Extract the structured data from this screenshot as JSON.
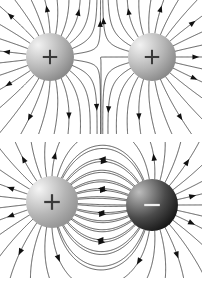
{
  "figure": {
    "background_color": "#ffffff",
    "width": 202,
    "height": 284,
    "line_color": "#4a4a4a",
    "arrow_color": "#111111"
  },
  "panels": [
    {
      "id": "panel-like",
      "name": "like-charges-panel",
      "caption": "Two like positive charges",
      "x": 0,
      "y": 0,
      "width": 202,
      "height": 134,
      "charges": [
        {
          "id": "charge-top-left",
          "name": "positive-charge-left",
          "sign": "+",
          "polarity": "positive",
          "q": 1,
          "cx": 50,
          "cy": 57,
          "r": 24,
          "fill_center": "#f2f2f2",
          "fill_edge": "#7d7d7d",
          "sign_color": "#3a3a3a",
          "highlight_x": 38,
          "highlight_y": 45,
          "n_lines": 26,
          "start_angle_deg": 0
        },
        {
          "id": "charge-top-right",
          "name": "positive-charge-right",
          "sign": "+",
          "polarity": "positive",
          "q": 1,
          "cx": 152,
          "cy": 57,
          "r": 24,
          "fill_center": "#f2f2f2",
          "fill_edge": "#7d7d7d",
          "sign_color": "#3a3a3a",
          "highlight_x": 140,
          "highlight_y": 45,
          "n_lines": 26,
          "start_angle_deg": 6.9
        }
      ],
      "arrows_per_line": 1,
      "arrow_fraction": 0.62,
      "arrow_size": 4.2
    },
    {
      "id": "panel-unlike",
      "name": "unlike-charges-panel",
      "caption": "A positive and a negative charge (electric dipole)",
      "x": 0,
      "y": 142,
      "width": 202,
      "height": 136,
      "charges": [
        {
          "id": "charge-bottom-left",
          "name": "positive-charge-dipole",
          "sign": "+",
          "polarity": "positive",
          "q": 1,
          "cx": 52,
          "cy": 60,
          "r": 26,
          "fill_center": "#f5f5f5",
          "fill_edge": "#8a8a8a",
          "sign_color": "#3a3a3a",
          "highlight_x": 39,
          "highlight_y": 47,
          "n_lines": 30,
          "start_angle_deg": 0
        },
        {
          "id": "charge-bottom-right",
          "name": "negative-charge-dipole",
          "sign": "−",
          "polarity": "negative",
          "q": -1,
          "cx": 152,
          "cy": 63,
          "r": 26,
          "fill_center": "#bdbdbd",
          "fill_edge": "#0a0a0a",
          "sign_color": "#efefef",
          "highlight_x": 139,
          "highlight_y": 50,
          "n_lines": 30,
          "start_angle_deg": 6.0
        }
      ],
      "arrows_per_line": 1,
      "arrow_fraction": 0.5,
      "arrow_size": 4.4
    }
  ],
  "legend": {
    "positive_symbol": "+",
    "negative_symbol": "−"
  }
}
